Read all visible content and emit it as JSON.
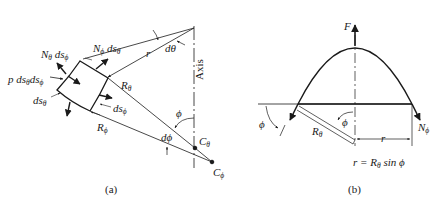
{
  "figure_a": {
    "caption": "(a)",
    "labels": {
      "n_theta": "N",
      "n_theta_sub": "θ",
      "n_theta_ds": " ds",
      "n_theta_ds_sub": "ϕ",
      "n_phi": "N",
      "n_phi_sub": "ϕ",
      "n_phi_ds": " ds",
      "n_phi_ds_sub": "θ",
      "pressure": "p ds",
      "pressure_sub1": "θ",
      "pressure_ds": "ds",
      "pressure_sub2": "ϕ",
      "ds_theta": "ds",
      "ds_theta_sub": "θ",
      "ds_phi": "ds",
      "ds_phi_sub": "ϕ",
      "r": "r",
      "d_theta": "dθ",
      "r_theta": "R",
      "r_theta_sub": "θ",
      "r_phi": "R",
      "r_phi_sub": "ϕ",
      "phi": "ϕ",
      "d_phi": "dϕ",
      "c_theta": "C",
      "c_theta_sub": "θ",
      "c_phi": "C",
      "c_phi_sub": "ϕ",
      "axis": "Axis"
    }
  },
  "figure_b": {
    "caption": "(b)",
    "labels": {
      "force": "F",
      "n_phi": "N",
      "n_phi_sub": "ϕ",
      "phi_left": "ϕ",
      "phi_center": "ϕ",
      "r_theta": "R",
      "r_theta_sub": "θ",
      "r": "r",
      "equation": "r = R",
      "equation_sub": "θ",
      "equation_tail": " sin ϕ"
    }
  }
}
